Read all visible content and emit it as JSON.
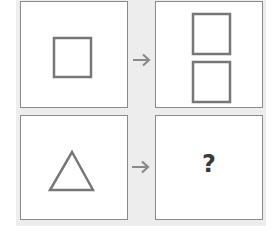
{
  "puzzle": {
    "type": "visual-analogy",
    "colors": {
      "stroke": "#777777",
      "panel_border": "#8a8a8a",
      "background": "#ededed",
      "question": "#3a3a3a"
    },
    "panels": [
      {
        "position": "top-left",
        "content": "single square"
      },
      {
        "position": "top-right",
        "content": "two stacked squares"
      },
      {
        "position": "bottom-left",
        "content": "single triangle"
      },
      {
        "position": "bottom-right",
        "content": "unknown"
      }
    ],
    "arrows": [
      "right-arrow",
      "right-arrow"
    ],
    "question_mark": "?"
  }
}
